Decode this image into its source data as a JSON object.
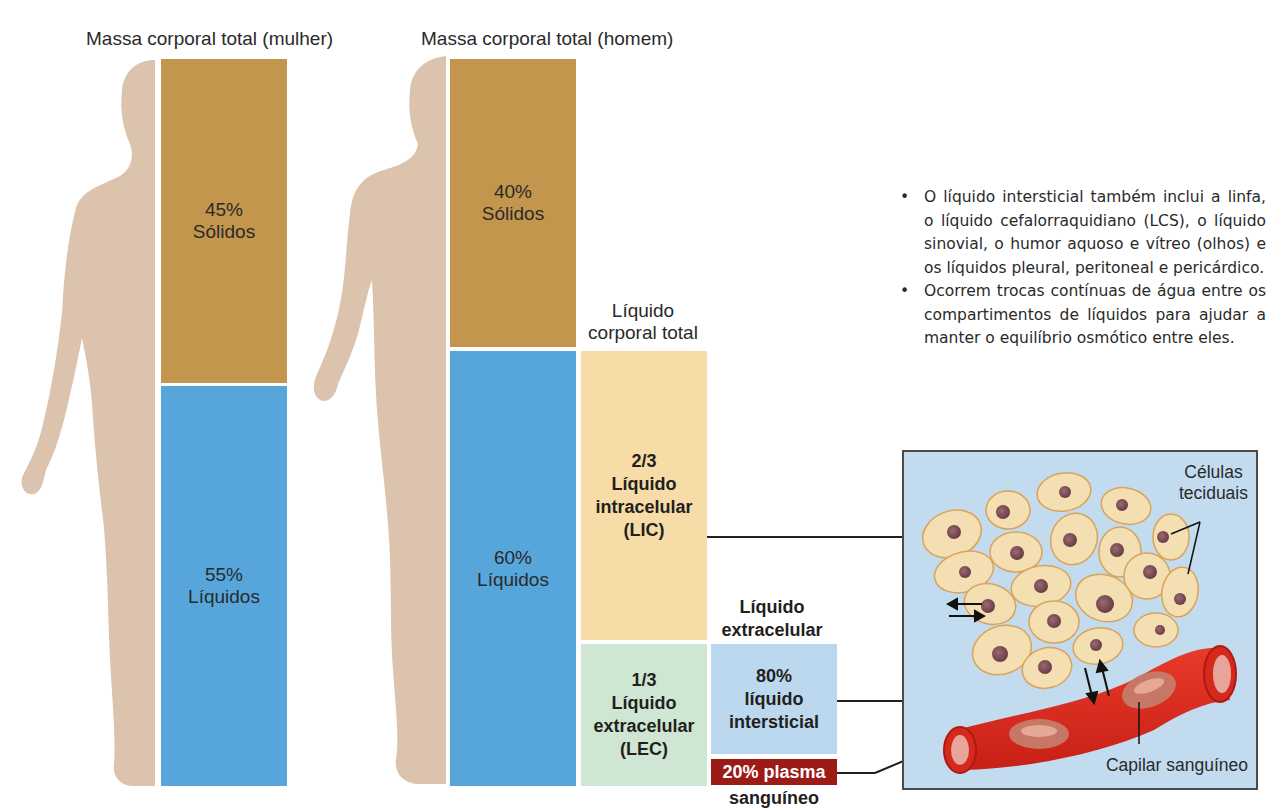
{
  "female": {
    "title": "Massa corporal total (mulher)",
    "solids": {
      "percent": "45%",
      "label": "Sólidos"
    },
    "liquids": {
      "percent": "55%",
      "label": "Líquidos"
    }
  },
  "male": {
    "title": "Massa corporal total (homem)",
    "solids": {
      "percent": "40%",
      "label": "Sólidos"
    },
    "liquids": {
      "percent": "60%",
      "label": "Líquidos"
    }
  },
  "total_body_fluid": {
    "title_line1": "Líquido",
    "title_line2": "corporal total",
    "intracellular": {
      "fraction": "2/3",
      "line1": "Líquido",
      "line2": "intracelular",
      "abbr": "(LIC)"
    },
    "extracellular": {
      "fraction": "1/3",
      "line1": "Líquido",
      "line2": "extracelular",
      "abbr": "(LEC)"
    }
  },
  "extracellular_fluid": {
    "title_line1": "Líquido",
    "title_line2": "extracelular",
    "interstitial": {
      "percent": "80%",
      "line1": "líquido",
      "line2": "intersticial"
    },
    "plasma": {
      "label": "20% plasma",
      "line2": "sanguíneo"
    }
  },
  "notes": [
    "O líquido intersticial também inclui a linfa, o líquido cefalorraquidiano (LCS), o líquido sinovial, o humor aquoso e vítreo (olhos) e os líquidos pleural, peritoneal e pericárdico.",
    "Ocorrem trocas contínuas de água entre os compartimentos de líquidos para ajudar a manter o equilíbrio osmótico entre eles."
  ],
  "illustration": {
    "cells_label_line1": "Células",
    "cells_label_line2": "teciduais",
    "capillary_label": "Capilar sanguíneo"
  },
  "colors": {
    "solids": "#c3964e",
    "liquids": "#56a6dc",
    "intracellular": "#f7dca7",
    "extracellular": "#cfe6d2",
    "interstitial": "#bcd8ef",
    "plasma": "#9c1b17",
    "body_silhouette": "#dcc3ae"
  }
}
